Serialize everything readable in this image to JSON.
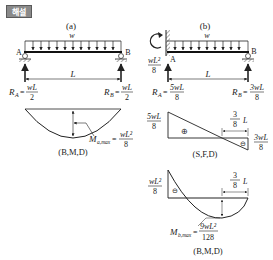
{
  "header": {
    "badge_label": "해설"
  },
  "panel_a": {
    "title": "(a)",
    "load_label": "w",
    "support_left": "A",
    "support_right": "B",
    "span_label": "L",
    "reaction_left": {
      "name": "R",
      "sub": "A",
      "num": "wL",
      "den": "2"
    },
    "reaction_right": {
      "name": "R",
      "sub": "B",
      "num": "wL",
      "den": "2"
    },
    "bmd": {
      "max_label": "M",
      "max_sub": "a,max",
      "max_num": "wL²",
      "max_den": "8",
      "caption": "(B,M,D)"
    }
  },
  "panel_b": {
    "title": "(b)",
    "load_label": "w",
    "support_left": "A",
    "support_right": "B",
    "span_label": "L",
    "fixed_moment": {
      "num": "wL²",
      "den": "8"
    },
    "reaction_left": {
      "name": "R",
      "sub": "A",
      "num": "5wL",
      "den": "8"
    },
    "reaction_right": {
      "name": "R",
      "sub": "B",
      "num": "3wL",
      "den": "8"
    },
    "sfd": {
      "left_num": "5wL",
      "left_den": "8",
      "right_num": "3wL",
      "right_den": "8",
      "zero_num": "3",
      "zero_den": "8",
      "zero_suffix": "L",
      "pos_sign": "⊕",
      "neg_sign": "⊖",
      "caption": "(S,F,D)"
    },
    "bmd": {
      "left_num": "wL²",
      "left_den": "8",
      "neg_sign": "⊖",
      "dist_num": "3",
      "dist_den": "8",
      "dist_suffix": "L",
      "max_label": "M",
      "max_sub": "b,max",
      "max_num": "9wL²",
      "max_den": "128",
      "caption": "(B,M,D)"
    }
  }
}
